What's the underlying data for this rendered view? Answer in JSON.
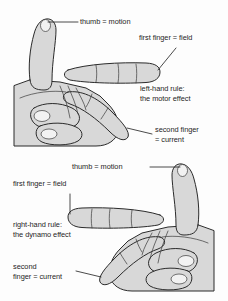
{
  "figure": {
    "background_color": "#fdfdfd",
    "ink_color": "#1d1d1d",
    "hand_fill_color": "#d8d8d8",
    "hand_outline_color": "#2b2b2b"
  },
  "diagrams": [
    {
      "id": "left-hand-rule",
      "hand": "left hand",
      "rule_title": "left-hand rule:",
      "rule_subtitle": "the motor effect",
      "labels": {
        "thumb": "thumb = motion",
        "first_finger": "first finger = field",
        "second_finger_line1": "second finger",
        "second_finger_line2": "= current"
      }
    },
    {
      "id": "right-hand-rule",
      "hand": "right hand",
      "rule_title": "right-hand rule:",
      "rule_subtitle": "the dynamo effect",
      "labels": {
        "thumb": "thumb = motion",
        "first_finger": "first finger = field",
        "second_finger_line1": "second",
        "second_finger_line2": "finger = current"
      }
    }
  ]
}
